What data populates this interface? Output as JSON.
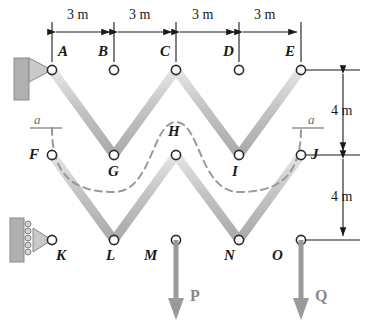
{
  "figure": {
    "colors": {
      "member_fill": "#c9c9c9",
      "member_edge": "#8f8f8f",
      "node_stroke": "#2b2b2b",
      "node_fill": "#ffffff",
      "dimension": "#1a1a1a",
      "section_dash": "#9a9a9a",
      "load_arrow": "#9a9a9a",
      "support_wall": "#a8a8a8",
      "background": "#ffffff"
    }
  },
  "geometry": {
    "columns_x": [
      52,
      114,
      176,
      239,
      301
    ],
    "rows_y": [
      70,
      155,
      240
    ],
    "bay_width_px": 62,
    "story_height_px": 85
  },
  "nodes": [
    {
      "id": "A",
      "x": 52,
      "y": 70,
      "label_x": 58,
      "label_y": 44
    },
    {
      "id": "B",
      "x": 114,
      "y": 70,
      "label_x": 98,
      "label_y": 44
    },
    {
      "id": "C",
      "x": 176,
      "y": 70,
      "label_x": 160,
      "label_y": 44
    },
    {
      "id": "D",
      "x": 239,
      "y": 70,
      "label_x": 223,
      "label_y": 44
    },
    {
      "id": "E",
      "x": 301,
      "y": 70,
      "label_x": 285,
      "label_y": 44
    },
    {
      "id": "F",
      "x": 52,
      "y": 155,
      "label_x": 29,
      "label_y": 148
    },
    {
      "id": "G",
      "x": 114,
      "y": 155,
      "label_x": 108,
      "label_y": 168
    },
    {
      "id": "H",
      "x": 176,
      "y": 155,
      "label_x": 168,
      "label_y": 126
    },
    {
      "id": "I",
      "x": 239,
      "y": 155,
      "label_x": 232,
      "label_y": 168
    },
    {
      "id": "J",
      "x": 301,
      "y": 155,
      "label_x": 313,
      "label_y": 148
    },
    {
      "id": "K",
      "x": 52,
      "y": 240,
      "label_x": 56,
      "label_y": 254
    },
    {
      "id": "L",
      "x": 114,
      "y": 240,
      "label_x": 106,
      "label_y": 254
    },
    {
      "id": "M",
      "x": 176,
      "y": 240,
      "label_x": 144,
      "label_y": 254
    },
    {
      "id": "N",
      "x": 239,
      "y": 240,
      "label_x": 224,
      "label_y": 254
    },
    {
      "id": "O",
      "x": 301,
      "y": 240,
      "label_x": 272,
      "label_y": 254
    }
  ],
  "members": {
    "top_chord": [
      [
        "A",
        "B"
      ],
      [
        "B",
        "C"
      ],
      [
        "C",
        "D"
      ],
      [
        "D",
        "E"
      ]
    ],
    "middle_chord": [
      [
        "F",
        "G"
      ],
      [
        "G",
        "H"
      ],
      [
        "H",
        "I"
      ],
      [
        "I",
        "J"
      ]
    ],
    "bottom_chord": [
      [
        "K",
        "L"
      ],
      [
        "L",
        "M"
      ],
      [
        "M",
        "N"
      ],
      [
        "N",
        "O"
      ]
    ],
    "verticals": [
      [
        "A",
        "F"
      ],
      [
        "F",
        "K"
      ],
      [
        "B",
        "G"
      ],
      [
        "C",
        "H"
      ],
      [
        "H",
        "M"
      ],
      [
        "D",
        "I"
      ],
      [
        "E",
        "J"
      ],
      [
        "J",
        "O"
      ]
    ],
    "diagonals": [
      [
        "A",
        "G"
      ],
      [
        "C",
        "G"
      ],
      [
        "C",
        "I"
      ],
      [
        "E",
        "I"
      ],
      [
        "F",
        "L"
      ],
      [
        "H",
        "L"
      ],
      [
        "H",
        "N"
      ],
      [
        "J",
        "N"
      ]
    ]
  },
  "dimensions": {
    "horizontal": [
      {
        "label": "3 m",
        "from": "A",
        "to": "B"
      },
      {
        "label": "3 m",
        "from": "B",
        "to": "C"
      },
      {
        "label": "3 m",
        "from": "C",
        "to": "D"
      },
      {
        "label": "3 m",
        "from": "D",
        "to": "E"
      }
    ],
    "vertical": [
      {
        "label": "4 m",
        "from": "E",
        "to": "J"
      },
      {
        "label": "4 m",
        "from": "J",
        "to": "O"
      }
    ]
  },
  "section": {
    "label_left": "a",
    "label_right": "a",
    "name": "section-a-a"
  },
  "loads": [
    {
      "label": "P",
      "at_node": "M",
      "direction": "down",
      "x": 176,
      "tip_y": 318,
      "label_x": 190,
      "label_y": 296
    },
    {
      "label": "Q",
      "at_node": "O",
      "direction": "down",
      "x": 301,
      "tip_y": 318,
      "label_x": 315,
      "label_y": 296
    }
  ],
  "supports": [
    {
      "type": "pin",
      "at_node": "A",
      "name": "pin-support-A"
    },
    {
      "type": "roller",
      "at_node": "K",
      "name": "roller-support-K"
    }
  ]
}
